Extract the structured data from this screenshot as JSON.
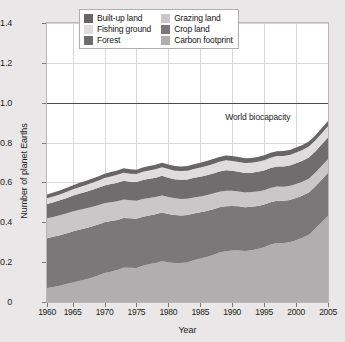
{
  "chart_data": {
    "type": "area",
    "title": "",
    "subtitle": "",
    "xlabel": "Year",
    "ylabel": "Number of planet Earths",
    "xlim": [
      1961,
      2005
    ],
    "ylim": [
      0,
      1.4
    ],
    "xticks": [
      1960,
      1965,
      1970,
      1975,
      1980,
      1985,
      1990,
      1995,
      2000,
      2005
    ],
    "yticks": [
      "0",
      "0.2",
      "0.4",
      "0.6",
      "0.8",
      "1.0",
      "1.2",
      "1.4"
    ],
    "ytick_values": [
      0,
      0.2,
      0.4,
      0.6,
      0.8,
      1.0,
      1.2,
      1.4
    ],
    "grid": true,
    "legend_position": "top-center",
    "stacked": true,
    "stack_order_bottom_to_top": [
      "Carbon footprint",
      "Crop land",
      "Grazing land",
      "Forest",
      "Fishing ground",
      "Built-up land"
    ],
    "x": [
      1961,
      1962,
      1963,
      1964,
      1965,
      1966,
      1967,
      1968,
      1969,
      1970,
      1971,
      1972,
      1973,
      1974,
      1975,
      1976,
      1977,
      1978,
      1979,
      1980,
      1981,
      1982,
      1983,
      1984,
      1985,
      1986,
      1987,
      1988,
      1989,
      1990,
      1991,
      1992,
      1993,
      1994,
      1995,
      1996,
      1997,
      1998,
      1999,
      2000,
      2001,
      2002,
      2003,
      2004,
      2005
    ],
    "series": [
      {
        "name": "Carbon footprint",
        "color": "#b0aeae",
        "values": [
          0.07,
          0.075,
          0.082,
          0.09,
          0.098,
          0.106,
          0.113,
          0.122,
          0.133,
          0.145,
          0.152,
          0.16,
          0.172,
          0.172,
          0.17,
          0.182,
          0.19,
          0.196,
          0.205,
          0.2,
          0.196,
          0.196,
          0.2,
          0.21,
          0.218,
          0.226,
          0.236,
          0.248,
          0.255,
          0.258,
          0.258,
          0.256,
          0.26,
          0.266,
          0.275,
          0.288,
          0.296,
          0.296,
          0.3,
          0.31,
          0.322,
          0.338,
          0.368,
          0.4,
          0.432
        ]
      },
      {
        "name": "Crop land",
        "color": "#7a7878",
        "values": [
          0.25,
          0.252,
          0.253,
          0.254,
          0.256,
          0.256,
          0.257,
          0.257,
          0.256,
          0.255,
          0.254,
          0.252,
          0.25,
          0.248,
          0.248,
          0.246,
          0.244,
          0.244,
          0.244,
          0.242,
          0.24,
          0.238,
          0.236,
          0.234,
          0.232,
          0.231,
          0.23,
          0.228,
          0.226,
          0.224,
          0.222,
          0.22,
          0.218,
          0.216,
          0.214,
          0.212,
          0.212,
          0.212,
          0.212,
          0.212,
          0.212,
          0.212,
          0.212,
          0.214,
          0.216
        ]
      },
      {
        "name": "Grazing land",
        "color": "#c9c7c7",
        "values": [
          0.1,
          0.1,
          0.1,
          0.1,
          0.1,
          0.1,
          0.099,
          0.098,
          0.097,
          0.096,
          0.095,
          0.094,
          0.092,
          0.09,
          0.09,
          0.089,
          0.088,
          0.087,
          0.086,
          0.085,
          0.084,
          0.083,
          0.082,
          0.081,
          0.08,
          0.079,
          0.078,
          0.077,
          0.077,
          0.076,
          0.075,
          0.074,
          0.074,
          0.073,
          0.072,
          0.072,
          0.071,
          0.07,
          0.07,
          0.07,
          0.07,
          0.069,
          0.068,
          0.068,
          0.068
        ]
      },
      {
        "name": "Forest",
        "color": "#6f6d6d",
        "values": [
          0.072,
          0.073,
          0.075,
          0.077,
          0.079,
          0.081,
          0.083,
          0.085,
          0.087,
          0.089,
          0.091,
          0.093,
          0.095,
          0.094,
          0.094,
          0.095,
          0.096,
          0.097,
          0.098,
          0.097,
          0.096,
          0.096,
          0.097,
          0.098,
          0.099,
          0.1,
          0.101,
          0.102,
          0.103,
          0.1,
          0.098,
          0.097,
          0.097,
          0.098,
          0.099,
          0.1,
          0.101,
          0.102,
          0.103,
          0.104,
          0.105,
          0.106,
          0.107,
          0.108,
          0.11
        ]
      },
      {
        "name": "Fishing ground",
        "color": "#dedcdc",
        "values": [
          0.028,
          0.029,
          0.03,
          0.031,
          0.032,
          0.033,
          0.034,
          0.035,
          0.036,
          0.037,
          0.038,
          0.039,
          0.04,
          0.04,
          0.04,
          0.041,
          0.042,
          0.042,
          0.043,
          0.043,
          0.043,
          0.044,
          0.044,
          0.045,
          0.046,
          0.047,
          0.048,
          0.049,
          0.05,
          0.05,
          0.05,
          0.05,
          0.05,
          0.051,
          0.051,
          0.052,
          0.052,
          0.053,
          0.053,
          0.054,
          0.054,
          0.055,
          0.055,
          0.056,
          0.056
        ]
      },
      {
        "name": "Built-up land",
        "color": "#676565",
        "values": [
          0.02,
          0.02,
          0.02,
          0.02,
          0.02,
          0.021,
          0.021,
          0.021,
          0.021,
          0.021,
          0.022,
          0.022,
          0.022,
          0.022,
          0.022,
          0.022,
          0.022,
          0.023,
          0.023,
          0.023,
          0.023,
          0.023,
          0.023,
          0.023,
          0.024,
          0.024,
          0.024,
          0.024,
          0.024,
          0.024,
          0.024,
          0.024,
          0.024,
          0.024,
          0.025,
          0.025,
          0.025,
          0.025,
          0.025,
          0.025,
          0.025,
          0.025,
          0.025,
          0.026,
          0.026
        ]
      }
    ],
    "annotations": [
      {
        "text": "World biocapacity",
        "x": 1994,
        "y": 0.93,
        "type": "text-label"
      }
    ],
    "reference_lines": [
      {
        "name": "World biocapacity",
        "value": 1.0,
        "orientation": "horizontal",
        "color": "#4a4a4a"
      }
    ]
  },
  "legend": {
    "items": [
      {
        "label": "Built-up land",
        "color": "#676565"
      },
      {
        "label": "Grazing land",
        "color": "#c9c7c7"
      },
      {
        "label": "Fishing ground",
        "color": "#dedcdc"
      },
      {
        "label": "Crop land",
        "color": "#7a7878"
      },
      {
        "label": "Forest",
        "color": "#6f6d6d"
      },
      {
        "label": "Carbon footprint",
        "color": "#b0aeae"
      }
    ]
  },
  "colors": {
    "page_background": "#e9e7e7",
    "plot_background": "#ffffff",
    "grid": "#d8d6d6",
    "axis_text": "#1d1d1d",
    "frame": "#b8b6b6"
  }
}
